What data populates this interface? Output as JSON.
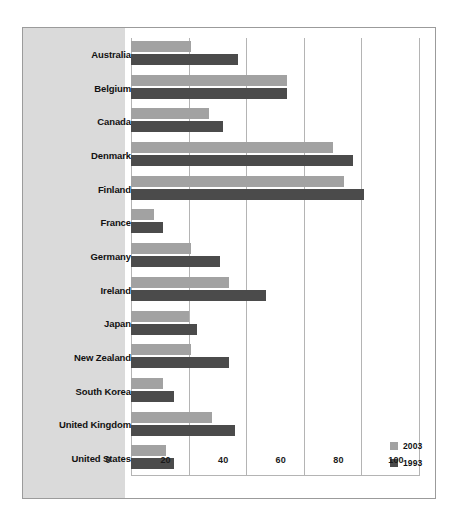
{
  "chart_data": {
    "type": "bar",
    "orientation": "horizontal",
    "title": "",
    "subtitle": "",
    "xlabel": "",
    "ylabel": "",
    "xlim": [
      0,
      100
    ],
    "xticks": [
      0,
      20,
      40,
      60,
      80,
      100
    ],
    "xtick_labels": [
      "0",
      "20",
      "40",
      "60",
      "80",
      "100"
    ],
    "grid": true,
    "grid_axis": "x",
    "legend_position": "bottom-right",
    "categories": [
      "Australia",
      "Belgium",
      "Canada",
      "Denmark",
      "Finland",
      "France",
      "Germany",
      "Ireland",
      "Japan",
      "New Zealand",
      "South Korea",
      "United Kingdom",
      "United States"
    ],
    "series": [
      {
        "name": "2003",
        "color": "#a2a2a2",
        "values": [
          21,
          54,
          27,
          70,
          74,
          8,
          21,
          34,
          20,
          21,
          11,
          28,
          12
        ]
      },
      {
        "name": "1993",
        "color": "#4b4b4b",
        "values": [
          37,
          54,
          32,
          77,
          81,
          11,
          31,
          47,
          23,
          34,
          15,
          36,
          15
        ]
      }
    ]
  },
  "legend": {
    "entries": [
      {
        "label": "2003",
        "color": "#a2a2a2",
        "swatch_name": "legend-swatch-2003"
      },
      {
        "label": "1993",
        "color": "#4b4b4b",
        "swatch_name": "legend-swatch-1993"
      }
    ]
  },
  "colors": {
    "series_2003": "#a2a2a2",
    "series_1993": "#4b4b4b",
    "panel_background": "#dadada",
    "frame_border": "#9b9b9b",
    "gridline": "#b4b4b4",
    "page_background": "#ffffff",
    "text": "#111111"
  }
}
